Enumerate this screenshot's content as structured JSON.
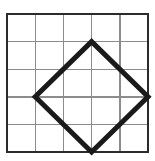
{
  "figure": {
    "caption": "Square grid with inscribed diamond",
    "background_color": "#ffffff",
    "partial_glyph_top": "g",
    "grid": {
      "columns": 5,
      "rows": 5,
      "cell_size_px": 27.6,
      "origin_x_px": 7,
      "origin_y_px": 14,
      "width_px": 141,
      "height_px": 138,
      "inner_line_color": "#8c8c8c",
      "inner_line_width_px": 1.4,
      "border_color": "#2b2b2b",
      "border_width_px": 2.2,
      "x_lines_px": [
        7,
        35.2,
        63.4,
        91.6,
        119.8,
        148
      ],
      "y_lines_px": [
        14,
        41.6,
        69.2,
        96.8,
        124.4,
        152
      ]
    },
    "shape": {
      "name": "diamond",
      "type": "polygon",
      "sides": 4,
      "stroke_color": "#1a1a1a",
      "stroke_width_px": 5,
      "fill": "none",
      "vertices_grid": [
        {
          "label": "top",
          "col": 3,
          "row": 1
        },
        {
          "label": "right",
          "col": 5,
          "row": 3
        },
        {
          "label": "bottom",
          "col": 3,
          "row": 5
        },
        {
          "label": "left",
          "col": 1,
          "row": 3
        }
      ],
      "vertices_px": [
        {
          "label": "top",
          "x": 91.6,
          "y": 41.6
        },
        {
          "label": "right",
          "x": 148,
          "y": 96.8
        },
        {
          "label": "bottom",
          "x": 91.6,
          "y": 152
        },
        {
          "label": "left",
          "x": 35.2,
          "y": 96.8
        }
      ],
      "points_attr": "91.6,41.6 148,96.8 91.6,152 35.2,96.8"
    }
  }
}
